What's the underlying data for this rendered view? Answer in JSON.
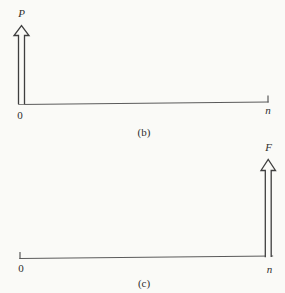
{
  "figures": {
    "b": {
      "force_label": "P",
      "origin_label": "0",
      "end_label": "n",
      "caption": "(b)"
    },
    "c": {
      "force_label": "F",
      "origin_label": "0",
      "end_label": "n",
      "caption": "(c)"
    }
  },
  "colors": {
    "background": "#fafaf7",
    "axis_line": "#5a5a5a",
    "arrow_outline": "#3f3f3f",
    "text": "#2e2e2e"
  }
}
